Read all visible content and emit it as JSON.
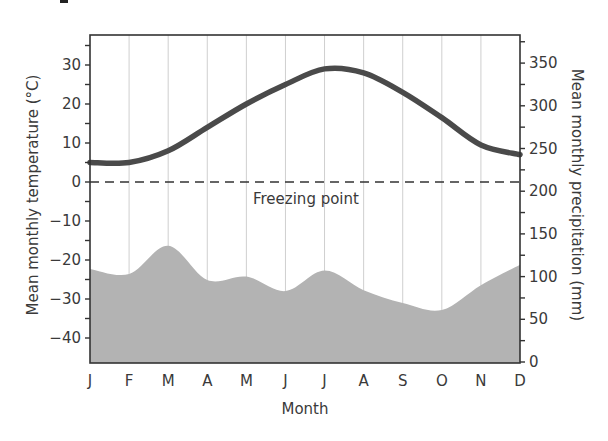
{
  "chart_data": {
    "type": "line+area",
    "title": "",
    "xlabel": "Month",
    "ylabel_left": "Mean monthly temperature (°C)",
    "ylabel_right": "Mean monthly precipitation (mm)",
    "categories": [
      "J",
      "F",
      "M",
      "A",
      "M",
      "J",
      "J",
      "A",
      "S",
      "O",
      "N",
      "D"
    ],
    "left_axis": {
      "ticks": [
        30,
        20,
        10,
        0,
        -10,
        -20,
        -30,
        -40
      ],
      "ylim": [
        -46,
        37.5
      ]
    },
    "right_axis": {
      "ticks": [
        350,
        300,
        250,
        200,
        150,
        100,
        50,
        0
      ],
      "ylim": [
        0,
        375
      ]
    },
    "series": [
      {
        "name": "Mean monthly temperature",
        "axis": "left",
        "style": "line",
        "color": "#4a4a4a",
        "values": [
          5,
          5,
          8,
          14,
          20,
          25,
          29,
          28,
          23,
          16.5,
          9.5,
          7
        ]
      },
      {
        "name": "Mean monthly precipitation",
        "axis": "right",
        "style": "area",
        "color": "#b3b3b3",
        "values": [
          109,
          103,
          136,
          96,
          100,
          83,
          107,
          84,
          69,
          61,
          90,
          114
        ]
      }
    ],
    "annotations": [
      {
        "text": "Freezing point",
        "at_temperature": 0,
        "style": "dashed-line"
      }
    ],
    "grid": {
      "vertical": true,
      "horizontal": false
    },
    "legend": "none"
  },
  "labels": {
    "xlabel": "Month",
    "ylabel_left": "Mean monthly temperature (°C)",
    "ylabel_right": "Mean monthly precipitation (mm)",
    "freezing": "Freezing point"
  }
}
